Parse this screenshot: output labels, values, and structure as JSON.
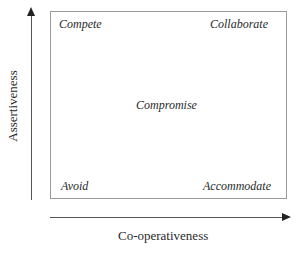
{
  "diagram": {
    "type": "conflict-modes-matrix",
    "x_axis_label": "Co-operativeness",
    "y_axis_label": "Assertiveness",
    "quadrants": {
      "top_left": "Compete",
      "top_right": "Collaborate",
      "center": "Compromise",
      "bottom_left": "Avoid",
      "bottom_right": "Accommodate"
    }
  }
}
